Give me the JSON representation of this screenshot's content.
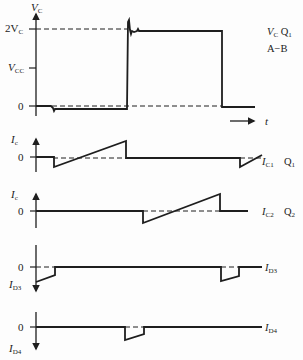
{
  "diagram": {
    "type": "switching waveforms",
    "colors": {
      "ink": "#1e1e1e",
      "background": "#fdfdfd"
    },
    "panels": [
      {
        "id": "vc",
        "axis_label": "V",
        "axis_label_sub": "C",
        "levels": [
          {
            "label": "2V",
            "sub": "C"
          },
          {
            "label": "V",
            "sub": "CC"
          },
          {
            "label": "0",
            "sub": ""
          }
        ],
        "legend_line1": "V",
        "legend_line1_sub": "C",
        "legend_line1_tail": " Q",
        "legend_line1_tail_sub": "1",
        "legend_line2": "A−B",
        "time_label": "t"
      },
      {
        "id": "ic1",
        "axis_label": "I",
        "axis_label_sub": "c",
        "zero_label": "0",
        "trace_label": "I",
        "trace_label_sub": "C1",
        "device": "Q",
        "device_sub": "1"
      },
      {
        "id": "ic2",
        "axis_label": "I",
        "axis_label_sub": "c",
        "zero_label": "0",
        "trace_label": "I",
        "trace_label_sub": "C2",
        "device": "Q",
        "device_sub": "2"
      },
      {
        "id": "id3",
        "axis_label": "I",
        "axis_label_sub": "D3",
        "zero_label": "0",
        "trace_label": "I",
        "trace_label_sub": "D3"
      },
      {
        "id": "id4",
        "axis_label": "I",
        "axis_label_sub": "D4",
        "zero_label": "0",
        "trace_label": "I",
        "trace_label_sub": "D4"
      }
    ]
  }
}
